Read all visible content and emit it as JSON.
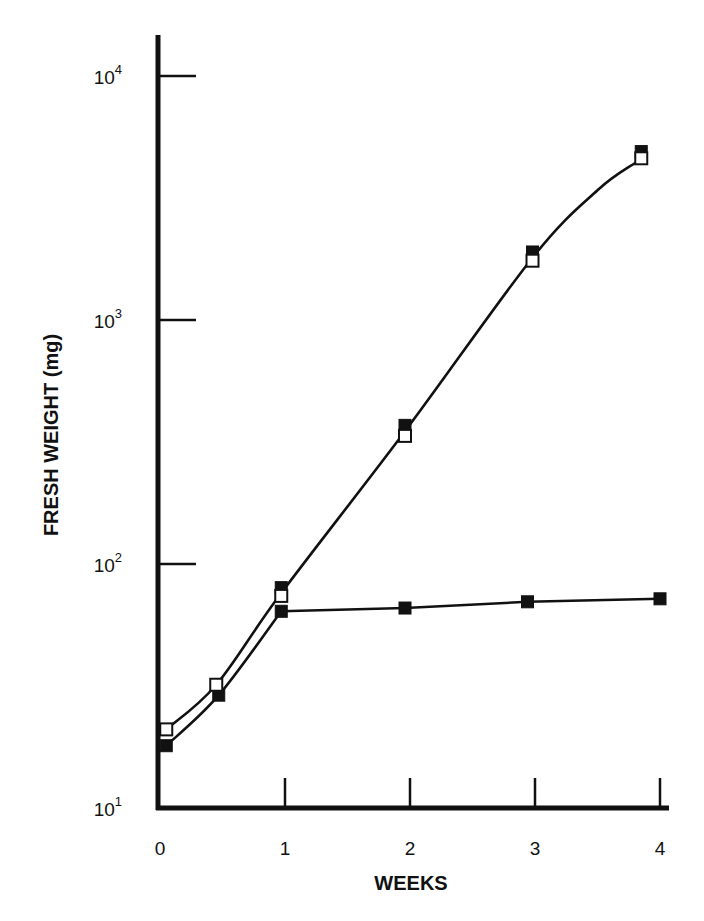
{
  "chart_data": {
    "type": "line",
    "title": "",
    "xlabel": "WEEKS",
    "ylabel": "FRESH WEIGHT (mg)",
    "xscale": "linear",
    "yscale": "log",
    "xlim": [
      0,
      4
    ],
    "ylim": [
      10,
      10000
    ],
    "grid": false,
    "legend": null,
    "x_ticks": [
      "0",
      "1",
      "2",
      "3",
      "4"
    ],
    "y_ticks": [
      {
        "base": "10",
        "exp": "1",
        "value": 10
      },
      {
        "base": "10",
        "exp": "2",
        "value": 100
      },
      {
        "base": "10",
        "exp": "3",
        "value": 1000
      },
      {
        "base": "10",
        "exp": "4",
        "value": 10000
      }
    ],
    "series": [
      {
        "name": "open squares (continued growth)",
        "marker": "open-square",
        "x": [
          0.05,
          0.45,
          0.97,
          1.96,
          2.98,
          3.85
        ],
        "values": [
          21,
          32,
          74,
          335,
          1750,
          4600
        ]
      },
      {
        "name": "filled squares (continued growth)",
        "marker": "filled-square",
        "x": [
          0.05,
          0.47,
          0.97,
          1.96,
          2.98,
          3.85
        ],
        "values": [
          18,
          29,
          80,
          370,
          1900,
          4900
        ]
      },
      {
        "name": "filled squares (growth arrest after week 1)",
        "marker": "filled-square",
        "x": [
          0.97,
          1.96,
          2.94,
          4.0
        ],
        "values": [
          64,
          66,
          70,
          72
        ]
      }
    ],
    "curves": [
      {
        "name": "upper-fit-curve",
        "x": [
          0.05,
          0.45,
          0.97,
          1.96,
          2.98,
          3.5,
          3.8
        ],
        "values": [
          21,
          32,
          76,
          350,
          1800,
          3400,
          4400
        ]
      },
      {
        "name": "lower-fit-curve",
        "x": [
          0.05,
          0.47,
          0.97
        ],
        "values": [
          18,
          29,
          64
        ]
      },
      {
        "name": "plateau-line",
        "x": [
          0.97,
          1.96,
          2.94,
          4.0
        ],
        "values": [
          64,
          66,
          70,
          72
        ]
      }
    ]
  }
}
